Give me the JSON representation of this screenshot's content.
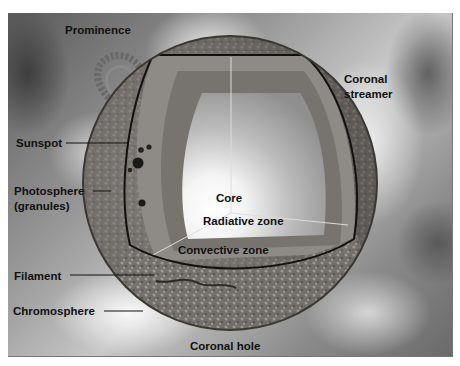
{
  "diagram": {
    "colors": {
      "background_dark": "#5a5a5a",
      "background_light": "#e8e8e8",
      "surface": "#6e6a66",
      "photosphere": "#8d8984",
      "convective_zone": "#7b7773",
      "radiative_zone": "#c9c9c9",
      "core": "#ffffff",
      "label_text": "#111111"
    },
    "labels": {
      "prominence": "Prominence",
      "coronal_streamer_line1": "Coronal",
      "coronal_streamer_line2": "streamer",
      "sunspot": "Sunspot",
      "photosphere_line1": "Photosphere",
      "photosphere_line2": "(granules)",
      "core": "Core",
      "radiative_zone": "Radiative zone",
      "convective_zone": "Convective zone",
      "filament": "Filament",
      "chromosphere": "Chromosphere",
      "coronal_hole": "Coronal hole"
    }
  }
}
